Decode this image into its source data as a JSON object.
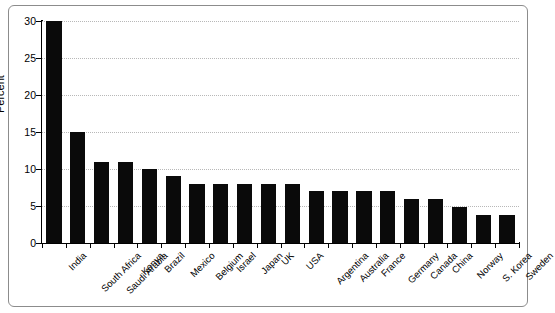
{
  "chart_data": {
    "type": "bar",
    "title": "",
    "subtitle": "",
    "xlabel": "",
    "ylabel": "Percent",
    "ylim": [
      0,
      30
    ],
    "yticks": [
      0,
      5,
      10,
      15,
      20,
      25,
      30
    ],
    "ytick_labels": [
      "0",
      "5",
      "10",
      "15",
      "20",
      "25",
      "30"
    ],
    "grid": true,
    "legend": false,
    "bar_color": "#0a0a0a",
    "categories": [
      "India",
      "South Africa",
      "Saudi Arabia",
      "Kenya",
      "Brazil",
      "Mexico",
      "Belgium",
      "Israel",
      "Japan",
      "UK",
      "USA",
      "Argentina",
      "Australia",
      "France",
      "Germany",
      "Canada",
      "China",
      "Norway",
      "S. Korea",
      "Sweden"
    ],
    "values": [
      30,
      15,
      11,
      11,
      10,
      9,
      8,
      8,
      8,
      8,
      8,
      7,
      7,
      7,
      7,
      6,
      6,
      4.8,
      3.8,
      3.8
    ]
  },
  "figure": {
    "background_color": "#ffffff",
    "frame_color": "#8c8c8c",
    "gridline_color": "#b8b8b8",
    "axis_color": "#000000"
  }
}
